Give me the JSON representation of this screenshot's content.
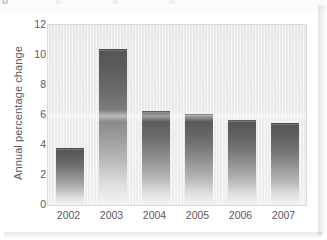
{
  "header": {
    "panel_label": "b",
    "ghost_ticks": [
      "6",
      "8",
      "0"
    ]
  },
  "chart_data": {
    "type": "bar",
    "title": "",
    "subtitle": "",
    "xlabel": "",
    "ylabel": "Annual percentage change",
    "categories": [
      "2002",
      "2003",
      "2004",
      "2005",
      "2006",
      "2007"
    ],
    "values": [
      3.8,
      10.4,
      6.3,
      6.1,
      5.65,
      5.45
    ],
    "ylim": [
      0,
      12
    ],
    "ytick_labels": [
      "0",
      "2",
      "4",
      "6",
      "8",
      "10",
      "12"
    ],
    "ytick_values": [
      0,
      2,
      4,
      6,
      8,
      10,
      12
    ],
    "grid": false,
    "legend": null,
    "legend_position": "none",
    "annotations": [],
    "bar_fill_top_color": "#545557",
    "bar_fill_bottom_color": "#f4f4f5",
    "plot_background_color": "#ebecee",
    "axis_text_color": "#58595b"
  }
}
